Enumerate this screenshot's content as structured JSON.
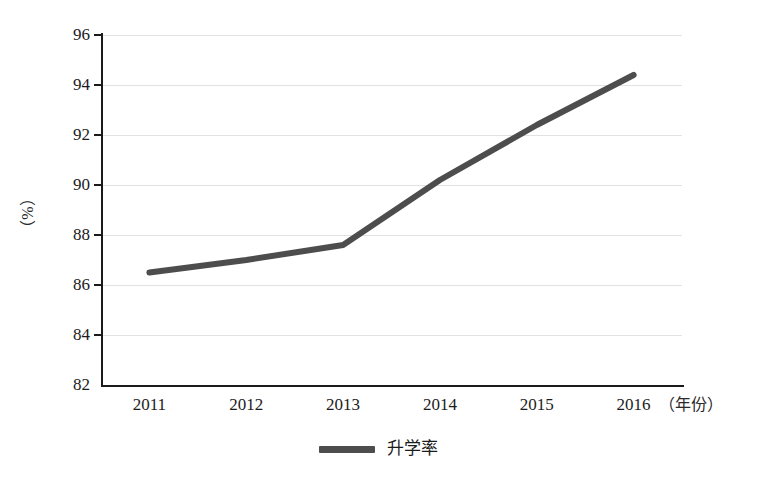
{
  "chart_data": {
    "type": "line",
    "title": "",
    "subtitle": "",
    "xlabel": "（年份）",
    "ylabel": "（%）",
    "categories": [
      "2011",
      "2012",
      "2013",
      "2014",
      "2015",
      "2016"
    ],
    "series": [
      {
        "name": "升学率",
        "values": [
          86.5,
          87.0,
          87.6,
          90.2,
          92.4,
          94.4
        ],
        "color": "#4d4d4d"
      }
    ],
    "ylim": [
      82,
      96
    ],
    "yticks": [
      82,
      84,
      86,
      88,
      90,
      92,
      94,
      96
    ],
    "ytick_labels": [
      "82",
      "84",
      "86",
      "88",
      "90",
      "92",
      "94",
      "96"
    ],
    "grid": true,
    "grid_color": "#e2e2e6",
    "axis_color": "#1a1a1a",
    "legend": {
      "position": "bottom",
      "entries": [
        "升学率"
      ]
    },
    "background": "#ffffff"
  }
}
